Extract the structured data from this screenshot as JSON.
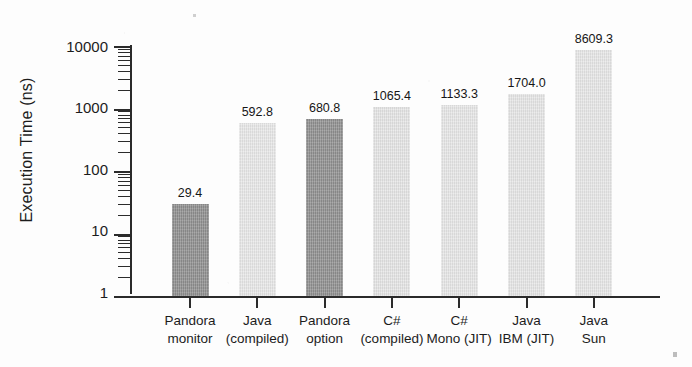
{
  "chart_data": {
    "type": "bar",
    "title": "",
    "xlabel": "",
    "ylabel": "Execution Time (ns)",
    "yscale": "log",
    "ylim": [
      1,
      10000
    ],
    "grid": false,
    "legend": "none",
    "ytick_labels": [
      "10000",
      "1000",
      "100",
      "10",
      "1"
    ],
    "ytick_values": [
      10000,
      1000,
      100,
      10,
      1
    ],
    "categories": [
      "Pandora\nmonitor",
      "Java\n(compiled)",
      "Pandora\noption",
      "C#\n(compiled)",
      "C#\nMono (JIT)",
      "Java\nIBM (JIT)",
      "Java\nSun"
    ],
    "values": [
      29.4,
      592.8,
      680.8,
      1065.4,
      1133.3,
      1704.0,
      8609.3
    ],
    "value_labels": [
      "29.4",
      "592.8",
      "680.8",
      "1065.4",
      "1133.3",
      "1704.0",
      "8609.3"
    ],
    "bar_colors": [
      "#8f8f8f",
      "#e9e9e9",
      "#909090",
      "#e6e6e6",
      "#e8e8e8",
      "#e7e7e7",
      "#e8e8e8"
    ],
    "series": [
      {
        "name": "Execution Time",
        "values": [
          29.4,
          592.8,
          680.8,
          1065.4,
          1133.3,
          1704.0,
          8609.3
        ]
      }
    ]
  },
  "axis": {
    "line_color": "#2b2b2b"
  },
  "bars": [
    {
      "label_line1": "Pandora",
      "label_line2": "monitor",
      "value_label": "29.4",
      "value": 29.4
    },
    {
      "label_line1": "Java",
      "label_line2": "(compiled)",
      "value_label": "592.8",
      "value": 592.8
    },
    {
      "label_line1": "Pandora",
      "label_line2": "option",
      "value_label": "680.8",
      "value": 680.8
    },
    {
      "label_line1": "C#",
      "label_line2": "(compiled)",
      "value_label": "1065.4",
      "value": 1065.4
    },
    {
      "label_line1": "C#",
      "label_line2": "Mono (JIT)",
      "value_label": "1133.3",
      "value": 1133.3
    },
    {
      "label_line1": "Java",
      "label_line2": "IBM (JIT)",
      "value_label": "1704.0",
      "value": 1704.0
    },
    {
      "label_line1": "Java",
      "label_line2": "Sun",
      "value_label": "8609.3",
      "value": 8609.3
    }
  ]
}
